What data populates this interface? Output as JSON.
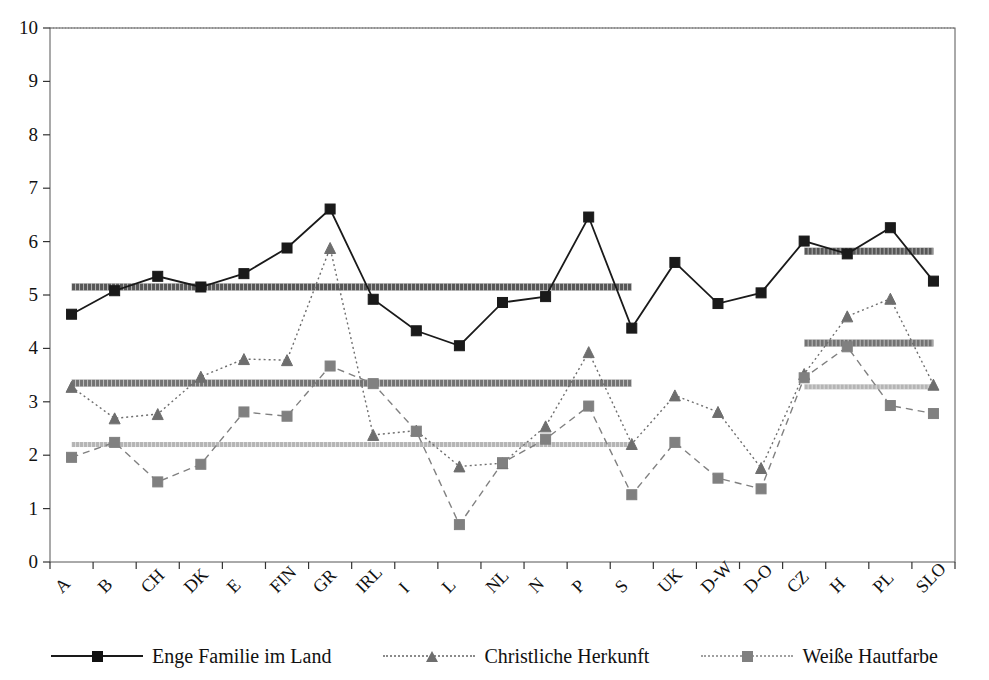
{
  "chart_data": {
    "type": "line",
    "title": "",
    "subtitle": "",
    "xlabel": "",
    "ylabel": "",
    "ylim": [
      0,
      10
    ],
    "ytick_labels": [
      "0",
      "1",
      "2",
      "3",
      "4",
      "5",
      "6",
      "7",
      "8",
      "9",
      "10"
    ],
    "ytick_values": [
      0,
      1,
      2,
      3,
      4,
      5,
      6,
      7,
      8,
      9,
      10
    ],
    "grid": false,
    "legend_position": "bottom",
    "categories": [
      "A",
      "B",
      "CH",
      "DK",
      "E",
      "FIN",
      "GR",
      "IRL",
      "I",
      "L",
      "NL",
      "N",
      "P",
      "S",
      "UK",
      "D-W",
      "D-O",
      "CZ",
      "H",
      "PL",
      "SLO"
    ],
    "series": [
      {
        "name": "Enge Familie im Land",
        "color": "#1a1a1a",
        "marker": "square",
        "linestyle": "solid",
        "values": [
          4.64,
          5.08,
          5.35,
          5.15,
          5.4,
          5.88,
          6.61,
          4.92,
          4.33,
          4.05,
          4.86,
          4.97,
          6.46,
          4.38,
          5.61,
          4.84,
          5.04,
          6.01,
          5.77,
          6.26,
          5.26
        ]
      },
      {
        "name": "Christliche Herkunft",
        "color": "#6e6e6e",
        "marker": "triangle",
        "linestyle": "dotted",
        "values": [
          3.28,
          2.69,
          2.77,
          3.47,
          3.8,
          3.78,
          5.88,
          2.38,
          2.46,
          1.79,
          1.85,
          2.54,
          3.93,
          2.21,
          3.12,
          2.81,
          1.76,
          3.52,
          4.6,
          4.93,
          3.32
        ]
      },
      {
        "name": "Weiße Hautfarbe",
        "color": "#808080",
        "marker": "square",
        "linestyle": "dashed",
        "values": [
          1.96,
          2.24,
          1.5,
          1.83,
          2.81,
          2.73,
          3.67,
          3.34,
          2.45,
          0.7,
          1.86,
          2.3,
          2.92,
          1.26,
          2.24,
          1.57,
          1.37,
          3.45,
          4.03,
          2.93,
          2.78
        ]
      }
    ],
    "reference_lines": [
      {
        "name": "enge-familie-mean-eu",
        "series": "Enge Familie im Land",
        "value": 5.15,
        "from_category": "A",
        "to_category": "S",
        "color": "#3a3a3a",
        "thickness": 7
      },
      {
        "name": "christliche-herkunft-mean-eu",
        "series": "Christliche Herkunft",
        "value": 3.35,
        "from_category": "A",
        "to_category": "S",
        "color": "#5a5a5a",
        "thickness": 7
      },
      {
        "name": "weisse-hautfarbe-mean-eu",
        "series": "Weiße Hautfarbe",
        "value": 2.2,
        "from_category": "A",
        "to_category": "S",
        "color": "#a8a8a8",
        "thickness": 5
      },
      {
        "name": "enge-familie-mean-cee",
        "series": "Enge Familie im Land",
        "value": 5.82,
        "from_category": "CZ",
        "to_category": "SLO",
        "color": "#3a3a3a",
        "thickness": 7
      },
      {
        "name": "christliche-herkunft-mean-cee",
        "series": "Christliche Herkunft",
        "value": 4.1,
        "from_category": "CZ",
        "to_category": "SLO",
        "color": "#5a5a5a",
        "thickness": 7
      },
      {
        "name": "weisse-hautfarbe-mean-cee",
        "series": "Weiße Hautfarbe",
        "value": 3.28,
        "from_category": "CZ",
        "to_category": "SLO",
        "color": "#a8a8a8",
        "thickness": 5
      }
    ]
  },
  "legend": {
    "items": [
      {
        "label": "Enge Familie im Land"
      },
      {
        "label": "Christliche Herkunft"
      },
      {
        "label": "Weiße Hautfarbe"
      }
    ]
  }
}
